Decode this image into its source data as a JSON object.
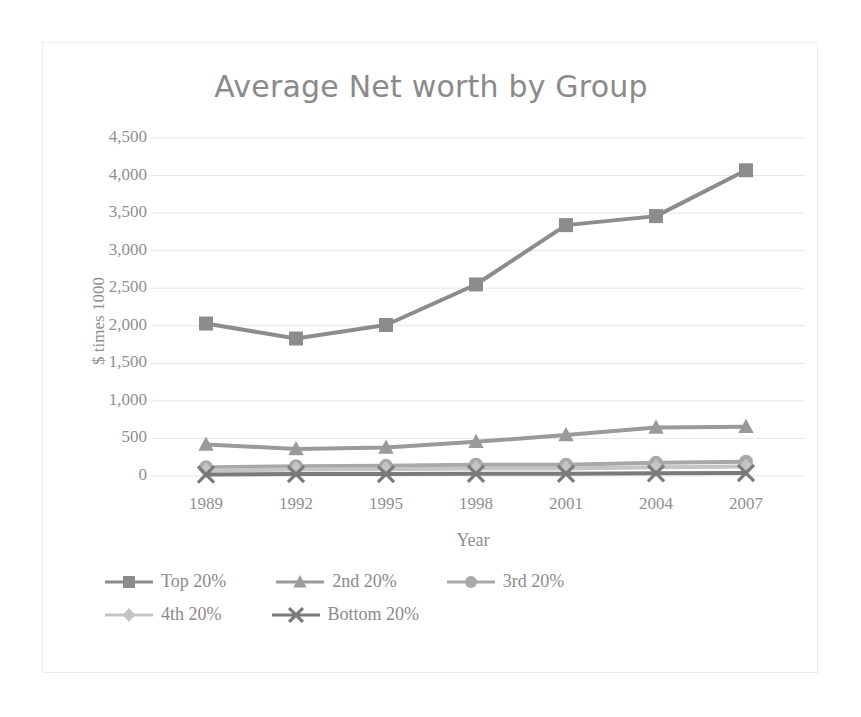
{
  "chart_data": {
    "type": "line",
    "title": "Average Net worth by Group",
    "xlabel": "Year",
    "ylabel": "$ times 1000",
    "categories": [
      "1989",
      "1992",
      "1995",
      "1998",
      "2001",
      "2004",
      "2007"
    ],
    "x": [
      1989,
      1992,
      1995,
      1998,
      2001,
      2004,
      2007
    ],
    "ylim": [
      0,
      4500
    ],
    "yticks": [
      "0",
      "500",
      "1,000",
      "1,500",
      "2,000",
      "2,500",
      "3,000",
      "3,500",
      "4,000",
      "4,500"
    ],
    "ytick_values": [
      0,
      500,
      1000,
      1500,
      2000,
      2500,
      3000,
      3500,
      4000,
      4500
    ],
    "grid": "horizontal",
    "legend_position": "bottom",
    "series": [
      {
        "name": "Top 20%",
        "marker": "square",
        "color": "#8c8c8c",
        "values": [
          2030,
          1830,
          2010,
          2550,
          3340,
          3460,
          4070
        ]
      },
      {
        "name": "2nd 20%",
        "marker": "triangle",
        "color": "#9a9a9a",
        "values": [
          420,
          360,
          380,
          455,
          545,
          645,
          655
        ]
      },
      {
        "name": "3rd 20%",
        "marker": "circle",
        "color": "#a8a8a8",
        "values": [
          115,
          130,
          135,
          150,
          150,
          175,
          190
        ]
      },
      {
        "name": "4th 20%",
        "marker": "diamond",
        "color": "#c4c4c4",
        "values": [
          75,
          85,
          90,
          100,
          100,
          115,
          125
        ]
      },
      {
        "name": "Bottom 20%",
        "marker": "x",
        "color": "#7a7a7a",
        "values": [
          20,
          25,
          25,
          30,
          30,
          35,
          40
        ]
      }
    ]
  },
  "legend": {
    "rows": [
      [
        "Top 20%",
        "2nd 20%",
        "3rd 20%"
      ],
      [
        "4th 20%",
        "Bottom 20%"
      ]
    ]
  }
}
